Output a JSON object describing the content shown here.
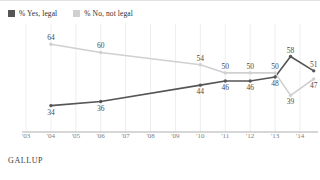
{
  "legend": {
    "items": [
      {
        "label": "% Yes, legal",
        "color": "#555555",
        "key": "yes"
      },
      {
        "label": "% No, not legal",
        "color": "#d0d0d0",
        "key": "no"
      }
    ]
  },
  "footer": {
    "source": "GALLUP"
  },
  "chart_data": {
    "type": "line",
    "title": "",
    "xlabel": "",
    "ylabel": "",
    "ylim": [
      25,
      70
    ],
    "grid": true,
    "legend_position": "top-left",
    "x_ticks": [
      "'03",
      "'04",
      "'05",
      "'06",
      "'07",
      "'08",
      "'09",
      "'10",
      "'11",
      "'12",
      "'13",
      "'14"
    ],
    "series": [
      {
        "name": "% Yes, legal",
        "color": "#555555",
        "points": [
          {
            "x": "'04",
            "value": 34,
            "label_pos": "below"
          },
          {
            "x": "'06",
            "value": 36,
            "label_pos": "below"
          },
          {
            "x": "'10",
            "value": 44,
            "label_pos": "below"
          },
          {
            "x": "'11",
            "value": 46,
            "label_pos": "below"
          },
          {
            "x": "'12",
            "value": 46,
            "label_pos": "below"
          },
          {
            "x": "'13",
            "value": 48,
            "label_pos": "below"
          },
          {
            "x": "'14a",
            "value": 58,
            "label_pos": "above"
          },
          {
            "x": "'14b",
            "value": 51,
            "label_pos": "above"
          }
        ]
      },
      {
        "name": "% No, not legal",
        "color": "#d0d0d0",
        "points": [
          {
            "x": "'04",
            "value": 64,
            "label_pos": "above"
          },
          {
            "x": "'06",
            "value": 60,
            "label_pos": "above"
          },
          {
            "x": "'10",
            "value": 54,
            "label_pos": "above"
          },
          {
            "x": "'11",
            "value": 50,
            "label_pos": "above"
          },
          {
            "x": "'12",
            "value": 50,
            "label_pos": "above"
          },
          {
            "x": "'13",
            "value": 50,
            "label_pos": "above"
          },
          {
            "x": "'14a",
            "value": 39,
            "label_pos": "below"
          },
          {
            "x": "'14b",
            "value": 47,
            "label_pos": "below"
          }
        ]
      }
    ]
  }
}
